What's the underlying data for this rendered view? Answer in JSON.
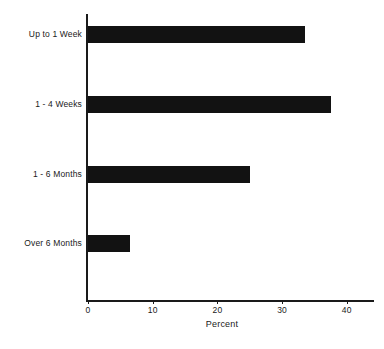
{
  "chart_data": {
    "type": "bar",
    "orientation": "horizontal",
    "title": "",
    "subtitle": "",
    "xlabel": "Percent",
    "ylabel": "",
    "categories": [
      "Up to 1 Week",
      "1 - 4 Weeks",
      "1 - 6 Months",
      "Over 6 Months"
    ],
    "values": [
      33.5,
      37.5,
      25,
      6.5
    ],
    "xlim": [
      0,
      43
    ],
    "xticks": [
      0,
      10,
      20,
      30,
      40
    ],
    "xtick_labels": [
      "0",
      "10",
      "20",
      "30",
      "40"
    ],
    "grid": false,
    "legend": false,
    "bar_color": "#121212",
    "axis_color": "#1a1a1a",
    "background": "#ffffff"
  },
  "axis": {
    "x_title": "Percent",
    "ticks": [
      {
        "label": "0",
        "value": 0
      },
      {
        "label": "10",
        "value": 10
      },
      {
        "label": "20",
        "value": 20
      },
      {
        "label": "30",
        "value": 30
      },
      {
        "label": "40",
        "value": 40
      }
    ]
  },
  "bars": [
    {
      "label": "Up to 1 Week",
      "value": 33.5
    },
    {
      "label": "1 - 4 Weeks",
      "value": 37.5
    },
    {
      "label": "1 - 6 Months",
      "value": 25
    },
    {
      "label": "Over 6 Months",
      "value": 6.5
    }
  ]
}
